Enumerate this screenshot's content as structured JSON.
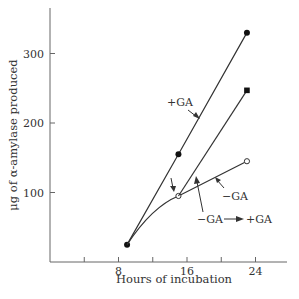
{
  "chart_data": {
    "type": "line",
    "title": "",
    "xlabel": "Hours of incubation",
    "ylabel": "μg of α-amylase produced",
    "xlim": [
      0,
      28
    ],
    "ylim": [
      0,
      360
    ],
    "x_ticks": [
      8,
      16,
      24
    ],
    "x_minor_ticks": [
      4,
      12,
      20
    ],
    "y_ticks": [
      100,
      200,
      300
    ],
    "grid": false,
    "legend": "none (inline annotations)",
    "series": [
      {
        "name": "+GA",
        "marker": "filled-circle",
        "points": [
          {
            "x": 9,
            "y": 25
          },
          {
            "x": 15,
            "y": 155
          },
          {
            "x": 23,
            "y": 330
          }
        ]
      },
      {
        "name": "−GA",
        "marker": "open-circle",
        "points": [
          {
            "x": 9,
            "y": 25
          },
          {
            "x": 15,
            "y": 95
          },
          {
            "x": 23,
            "y": 145
          }
        ]
      },
      {
        "name": "−GA → +GA",
        "marker": "filled-square",
        "points": [
          {
            "x": 15,
            "y": 95
          },
          {
            "x": 23,
            "y": 247
          }
        ]
      }
    ],
    "annotations": [
      {
        "text": "+GA",
        "points_to": "+GA line"
      },
      {
        "text": "−GA",
        "points_to": "−GA line"
      },
      {
        "text": "−GA",
        "arrow": "→",
        "text2": "+GA",
        "points_to": "transfer line"
      },
      {
        "text": "↓",
        "note": "downward arrow marking time of GA addition at 15 h"
      }
    ]
  }
}
